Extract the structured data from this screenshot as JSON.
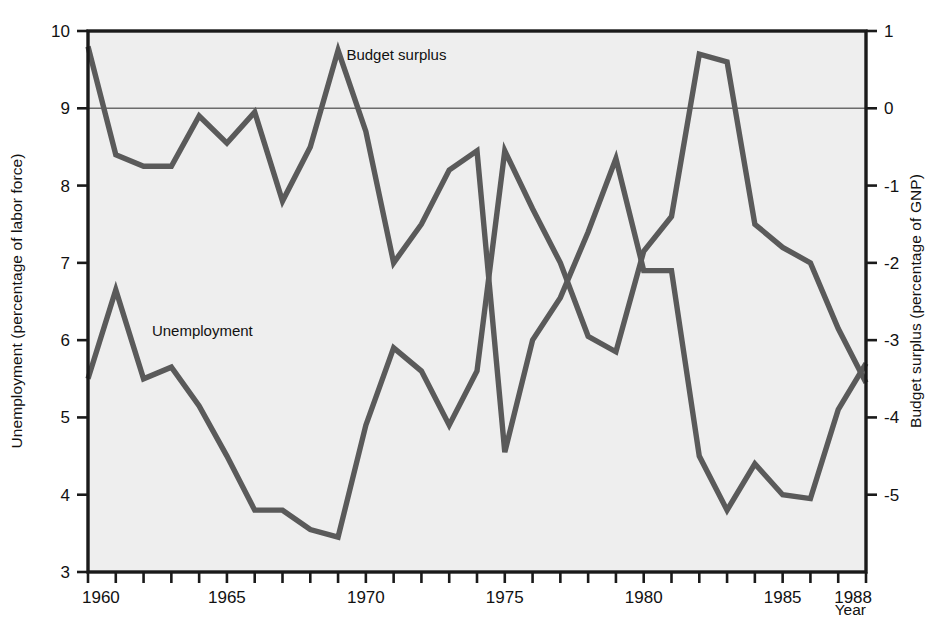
{
  "chart_data": {
    "type": "line",
    "title": "",
    "xlabel": "Year",
    "x": [
      1960,
      1961,
      1962,
      1963,
      1964,
      1965,
      1966,
      1967,
      1968,
      1969,
      1970,
      1971,
      1972,
      1973,
      1974,
      1975,
      1976,
      1977,
      1978,
      1979,
      1980,
      1981,
      1982,
      1983,
      1984,
      1985,
      1986,
      1987,
      1988
    ],
    "xlim": [
      1960,
      1988
    ],
    "xticks": [
      1960,
      1961,
      1962,
      1963,
      1964,
      1965,
      1966,
      1967,
      1968,
      1969,
      1970,
      1971,
      1972,
      1973,
      1974,
      1975,
      1976,
      1977,
      1978,
      1979,
      1980,
      1981,
      1982,
      1983,
      1984,
      1985,
      1986,
      1987,
      1988
    ],
    "xticklabels": [
      "1960",
      "",
      "",
      "",
      "",
      "1965",
      "",
      "",
      "",
      "",
      "1970",
      "",
      "",
      "",
      "",
      "1975",
      "",
      "",
      "",
      "",
      "1980",
      "",
      "",
      "",
      "",
      "1985",
      "",
      "",
      "1988"
    ],
    "grid": false,
    "legend_position": "inline-annotation",
    "left_axis": {
      "label": "Unemployment (percentage of labor force)",
      "ylim": [
        3,
        10
      ],
      "yticks": [
        3,
        4,
        5,
        6,
        7,
        8,
        9,
        10
      ],
      "yticklabels": [
        "3",
        "4",
        "5",
        "6",
        "7",
        "8",
        "9",
        "10"
      ]
    },
    "right_axis": {
      "label": "Budget surplus (percentage of GNP)",
      "ylim": [
        -6,
        1
      ],
      "yticks": [
        -5,
        -4,
        -3,
        -2,
        -1,
        0,
        1
      ],
      "yticklabels": [
        "-5",
        "-4",
        "-3",
        "-2",
        "-1",
        "0",
        "1"
      ]
    },
    "zero_line": {
      "right_axis_value": 0,
      "left_axis_value": 9,
      "description": "horizontal reference line at budget surplus = 0"
    },
    "series": [
      {
        "name": "Unemployment",
        "axis": "left",
        "annotation": "Unemployment",
        "units": "percentage of labor force",
        "color": "#5a5a5a",
        "values": [
          5.5,
          6.65,
          5.5,
          5.65,
          5.15,
          4.5,
          3.8,
          3.8,
          3.55,
          3.45,
          4.9,
          5.9,
          5.6,
          4.9,
          5.6,
          8.45,
          7.7,
          7.0,
          6.05,
          5.85,
          7.15,
          7.6,
          9.7,
          9.6,
          7.5,
          7.2,
          7.0,
          6.15,
          5.45
        ]
      },
      {
        "name": "Budget surplus",
        "axis": "right",
        "annotation": "Budget surplus",
        "units": "percentage of GNP",
        "color": "#5a5a5a",
        "values": [
          0.8,
          -0.6,
          -0.75,
          -0.75,
          -0.1,
          -0.45,
          -0.05,
          -1.2,
          -0.5,
          0.75,
          -0.3,
          -2.0,
          -1.5,
          -0.8,
          -0.55,
          -4.45,
          -3.0,
          -2.45,
          -1.6,
          -0.65,
          -2.1,
          -2.1,
          -4.5,
          -5.2,
          -4.6,
          -5.0,
          -5.05,
          -3.9,
          -3.3
        ]
      }
    ],
    "annotations": [
      {
        "text": "Budget surplus",
        "x": 1969.3,
        "y_left_axis": 9.62
      },
      {
        "text": "Unemployment",
        "x": 1962.3,
        "y_left_axis": 6.05
      }
    ],
    "colors": {
      "plot_background": "#eeeeee",
      "page_background": "#ffffff",
      "frame": "#1a1a1a",
      "line": "#5a5a5a",
      "zero_line": "#6b6b6b",
      "text": "#111111"
    }
  }
}
